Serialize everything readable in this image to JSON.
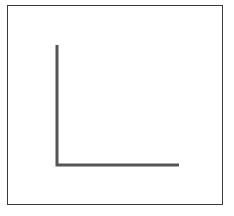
{
  "figure": {
    "frame": {
      "stroke": "#3a3a3a"
    },
    "l_shape": {
      "stroke": "#555555",
      "stroke_width": 3,
      "vertical": {
        "x": 57,
        "y1": 45,
        "y2": 165
      },
      "horizontal": {
        "y": 165,
        "x1": 57,
        "x2": 179
      }
    }
  }
}
